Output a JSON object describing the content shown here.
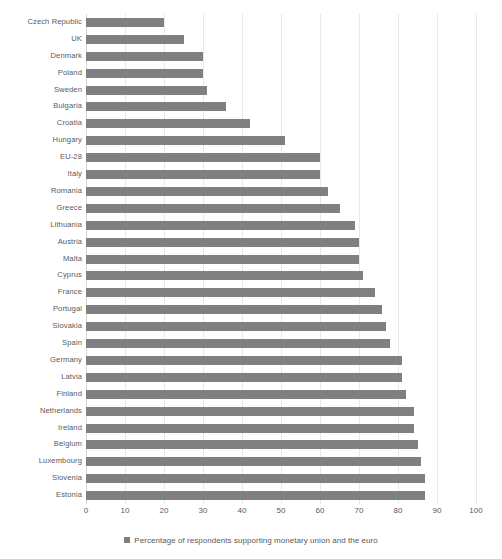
{
  "chart_data": {
    "type": "bar",
    "orientation": "horizontal",
    "title": "",
    "subtitle": "",
    "xlabel": "",
    "ylabel": "",
    "xlim": [
      0,
      100
    ],
    "xticks": [
      0,
      10,
      20,
      30,
      40,
      50,
      60,
      70,
      80,
      90,
      100
    ],
    "grid": true,
    "grid_axis": "x",
    "legend": {
      "position": "bottom-center",
      "entries": [
        {
          "label": "Percentage of respondents supporting monetary union and the euro",
          "color": "#808080",
          "marker": "square"
        }
      ]
    },
    "series_name": "Percentage of respondents supporting monetary union and the euro",
    "bar_color": "#808080",
    "categories": [
      "Czech Republic",
      "UK",
      "Denmark",
      "Poland",
      "Sweden",
      "Bulgaria",
      "Croatia",
      "Hungary",
      "EU-28",
      "Italy",
      "Romania",
      "Greece",
      "Lithuania",
      "Austria",
      "Malta",
      "Cyprus",
      "France",
      "Portugal",
      "Slovakia",
      "Spain",
      "Germany",
      "Latvia",
      "Finland",
      "Netherlands",
      "Ireland",
      "Belgium",
      "Luxembourg",
      "Slovenia",
      "Estonia"
    ],
    "values": [
      20,
      25,
      30,
      30,
      31,
      36,
      42,
      51,
      60,
      60,
      62,
      65,
      69,
      70,
      70,
      71,
      74,
      76,
      77,
      78,
      81,
      81,
      82,
      84,
      84,
      85,
      86,
      87,
      87
    ]
  },
  "axis": {
    "tick_color": "#5a5a5a",
    "gridline_color": "#e8e8e8"
  }
}
